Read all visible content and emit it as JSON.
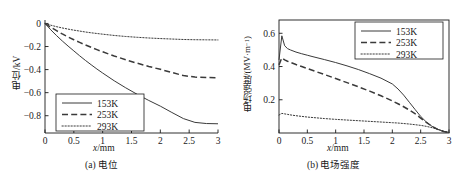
{
  "figure": {
    "panels": [
      {
        "id": "a",
        "caption": "(a) 电位",
        "xlabel_italic": "x",
        "xlabel_rest": "/mm",
        "ylabel": "电位/kV",
        "legend": [
          {
            "label": "153K",
            "style": "solid"
          },
          {
            "label": "253K",
            "style": "dashed"
          },
          {
            "label": "293K",
            "style": "dotted"
          }
        ],
        "xticks": [
          "0",
          "0.5",
          "1",
          "1.5",
          "2",
          "2.5",
          "3"
        ],
        "yticks": [
          "0",
          "−0.2",
          "−0.4",
          "−0.6",
          "−0.8"
        ]
      },
      {
        "id": "b",
        "caption": "(b) 电场强度",
        "xlabel_italic": "x",
        "xlabel_rest": "/mm",
        "ylabel_main": "电场强度/(MV·m",
        "ylabel_sup": "−1",
        "ylabel_tail": ")",
        "legend": [
          {
            "label": "153K",
            "style": "solid"
          },
          {
            "label": "253K",
            "style": "dashed"
          },
          {
            "label": "293K",
            "style": "dotted"
          }
        ],
        "xticks": [
          "0",
          "0.5",
          "1",
          "1.5",
          "2",
          "2.5",
          "3"
        ],
        "yticks": [
          "0.2",
          "0.4",
          "0.6"
        ]
      }
    ]
  },
  "chart_data": [
    {
      "type": "line",
      "panel": "a",
      "title": "(a) 电位",
      "xlabel": "x/mm",
      "ylabel": "电位/kV",
      "xlim": [
        0,
        3
      ],
      "ylim": [
        -0.95,
        0.03
      ],
      "grid": false,
      "legend_position": "lower-left",
      "x": [
        0,
        0.1,
        0.2,
        0.3,
        0.4,
        0.5,
        0.6,
        0.7,
        0.8,
        0.9,
        1.0,
        1.2,
        1.4,
        1.6,
        1.8,
        2.0,
        2.2,
        2.4,
        2.6,
        2.8,
        3.0
      ],
      "series": [
        {
          "name": "153K",
          "style": "solid",
          "values": [
            0,
            -0.055,
            -0.105,
            -0.152,
            -0.196,
            -0.238,
            -0.28,
            -0.32,
            -0.358,
            -0.395,
            -0.43,
            -0.497,
            -0.558,
            -0.615,
            -0.668,
            -0.717,
            -0.772,
            -0.825,
            -0.858,
            -0.868,
            -0.87
          ]
        },
        {
          "name": "253K",
          "style": "dashed",
          "values": [
            0,
            -0.033,
            -0.063,
            -0.091,
            -0.117,
            -0.141,
            -0.164,
            -0.186,
            -0.207,
            -0.227,
            -0.246,
            -0.282,
            -0.315,
            -0.345,
            -0.373,
            -0.398,
            -0.425,
            -0.452,
            -0.465,
            -0.469,
            -0.47
          ]
        },
        {
          "name": "293K",
          "style": "dotted",
          "values": [
            0,
            -0.015,
            -0.028,
            -0.039,
            -0.049,
            -0.058,
            -0.066,
            -0.074,
            -0.081,
            -0.087,
            -0.093,
            -0.104,
            -0.113,
            -0.12,
            -0.126,
            -0.131,
            -0.135,
            -0.139,
            -0.141,
            -0.142,
            -0.143
          ]
        }
      ]
    },
    {
      "type": "line",
      "panel": "b",
      "title": "(b) 电场强度",
      "xlabel": "x/mm",
      "ylabel": "电场强度/(MV·m⁻¹)",
      "xlim": [
        0,
        3
      ],
      "ylim": [
        0,
        0.68
      ],
      "grid": false,
      "legend_position": "upper-right",
      "x": [
        0,
        0.05,
        0.1,
        0.15,
        0.2,
        0.3,
        0.4,
        0.5,
        0.6,
        0.8,
        1.0,
        1.2,
        1.4,
        1.6,
        1.8,
        2.0,
        2.1,
        2.2,
        2.3,
        2.4,
        2.5,
        2.6,
        2.7,
        2.8,
        2.9,
        3.0
      ],
      "series": [
        {
          "name": "153K",
          "style": "solid",
          "values": [
            0.44,
            0.585,
            0.525,
            0.508,
            0.5,
            0.487,
            0.477,
            0.468,
            0.459,
            0.442,
            0.424,
            0.404,
            0.382,
            0.357,
            0.33,
            0.295,
            0.265,
            0.228,
            0.185,
            0.142,
            0.1,
            0.066,
            0.04,
            0.022,
            0.01,
            0.003
          ]
        },
        {
          "name": "253K",
          "style": "dashed",
          "values": [
            0.41,
            0.452,
            0.44,
            0.432,
            0.425,
            0.412,
            0.4,
            0.388,
            0.376,
            0.352,
            0.328,
            0.303,
            0.278,
            0.252,
            0.224,
            0.193,
            0.176,
            0.158,
            0.138,
            0.116,
            0.09,
            0.064,
            0.04,
            0.022,
            0.009,
            0.002
          ]
        },
        {
          "name": "293K",
          "style": "dotted",
          "values": [
            0.108,
            0.118,
            0.115,
            0.112,
            0.109,
            0.104,
            0.1,
            0.096,
            0.093,
            0.087,
            0.082,
            0.078,
            0.074,
            0.07,
            0.066,
            0.062,
            0.06,
            0.057,
            0.054,
            0.05,
            0.046,
            0.04,
            0.032,
            0.022,
            0.012,
            0.003
          ]
        }
      ]
    }
  ]
}
